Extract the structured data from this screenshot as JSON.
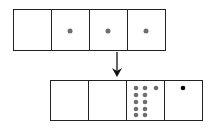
{
  "diagram": {
    "top_row": {
      "cells": [
        {
          "dots": 0,
          "dot_color": "#6e6e6e"
        },
        {
          "dots": 1,
          "dot_color": "#6e6e6e"
        },
        {
          "dots": 1,
          "dot_color": "#6e6e6e"
        },
        {
          "dots": 1,
          "dot_color": "#6e6e6e"
        }
      ]
    },
    "arrow": {
      "direction": "down"
    },
    "bottom_row": {
      "cells": [
        {
          "dots": 0,
          "dot_color": "#6e6e6e"
        },
        {
          "dots": 0,
          "dot_color": "#6e6e6e"
        },
        {
          "dots": 11,
          "dot_color": "#6e6e6e"
        },
        {
          "dots": 1,
          "dot_color": "#000000"
        }
      ]
    },
    "colors": {
      "stroke": "#222222",
      "gray_dot": "#6e6e6e",
      "black_dot": "#000000",
      "background": "#ffffff"
    }
  }
}
